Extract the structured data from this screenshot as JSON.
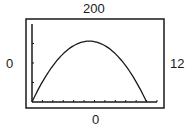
{
  "window": {
    "ymax_label": "200",
    "ymin_label": "0",
    "xmin_label": "0",
    "xmax_label": "12"
  },
  "chart_data": {
    "type": "line",
    "title": "",
    "xlabel": "",
    "ylabel": "",
    "xlim": [
      0,
      12
    ],
    "ylim": [
      0,
      200
    ],
    "x_tick_step": 1,
    "y_tick_step": 50,
    "grid": false,
    "legend": null,
    "series": [
      {
        "name": "parabola",
        "x": [
          0,
          1,
          2,
          3,
          4,
          5,
          5.6,
          6,
          7,
          8,
          9,
          10,
          11
        ],
        "values": [
          0,
          50,
          89,
          120,
          142,
          154,
          156,
          155,
          143,
          120,
          89,
          50,
          0
        ]
      }
    ],
    "annotations": [
      "Xmin=0",
      "Xmax=12",
      "Ymin=0",
      "Ymax=200"
    ]
  },
  "colors": {
    "line": "#1a1a1a",
    "frame": "#1a1a1a",
    "background": "#ffffff"
  }
}
